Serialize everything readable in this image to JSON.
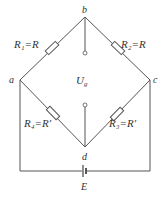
{
  "diagram": {
    "type": "wheatstone-bridge",
    "nodes": {
      "a": "a",
      "b": "b",
      "c": "c",
      "d": "d"
    },
    "resistors": [
      {
        "id": "R1",
        "label": "R₁=R",
        "between": [
          "a",
          "b"
        ]
      },
      {
        "id": "R2",
        "label": "R₂=R",
        "between": [
          "b",
          "c"
        ]
      },
      {
        "id": "R3",
        "label": "R₃=R′",
        "between": [
          "c",
          "d"
        ]
      },
      {
        "id": "R4",
        "label": "R₄=R′",
        "between": [
          "a",
          "d"
        ]
      }
    ],
    "output": {
      "label_main": "U",
      "label_sub": "g"
    },
    "source": {
      "label": "E"
    },
    "colors": {
      "line": "#555555",
      "text": "#333333",
      "background": "#ffffff"
    }
  }
}
